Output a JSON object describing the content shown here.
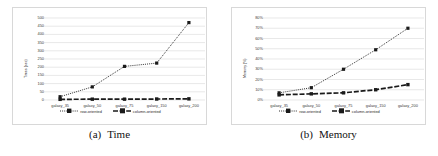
{
  "figure": {
    "panels": [
      {
        "caption_label": "(a)",
        "caption_text": "Time",
        "chart_data": {
          "type": "line",
          "title": "",
          "xlabel": "",
          "ylabel": "Times (sec)",
          "categories": [
            "galaxy_35",
            "galaxy_50",
            "galaxy_75",
            "galaxy_150",
            "galaxy_200"
          ],
          "yticks": [
            0,
            50,
            100,
            150,
            200,
            250,
            300,
            350,
            400,
            450,
            500
          ],
          "ylim": [
            0,
            500
          ],
          "ytick_labels": [
            "0",
            "50",
            "100",
            "150",
            "200",
            "250",
            "300",
            "350",
            "400",
            "450",
            "500"
          ],
          "grid": true,
          "legend_position": "bottom",
          "series": [
            {
              "name": "row-oriented",
              "style": "dotted",
              "values": [
                20,
                80,
                205,
                225,
                472
              ]
            },
            {
              "name": "column-oriented",
              "style": "dashed",
              "values": [
                4,
                5,
                5,
                6,
                7
              ]
            }
          ]
        }
      },
      {
        "caption_label": "(b)",
        "caption_text": "Memory",
        "chart_data": {
          "type": "line",
          "title": "",
          "xlabel": "",
          "ylabel": "Memory (%)",
          "categories": [
            "galaxy_35",
            "galaxy_50",
            "galaxy_75",
            "galaxy_150",
            "galaxy_200"
          ],
          "yticks": [
            0,
            10,
            20,
            30,
            40,
            50,
            60,
            70,
            80
          ],
          "ylim": [
            0,
            80
          ],
          "ytick_labels": [
            "0%",
            "10%",
            "20%",
            "30%",
            "40%",
            "50%",
            "60%",
            "70%",
            "80%"
          ],
          "grid": true,
          "legend_position": "bottom",
          "series": [
            {
              "name": "row-oriented",
              "style": "dotted",
              "values": [
                7,
                12,
                30,
                49,
                70
              ]
            },
            {
              "name": "column-oriented",
              "style": "dashed",
              "values": [
                5,
                6,
                7,
                10,
                15
              ]
            }
          ]
        }
      }
    ],
    "colors": {
      "series": "#1a1a1a",
      "grid": "#d9d9d9",
      "frame": "#d8d8d8",
      "text": "#2b2b2b",
      "background": "#ffffff"
    }
  }
}
